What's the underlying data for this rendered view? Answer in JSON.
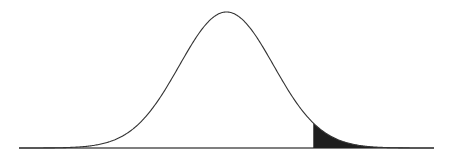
{
  "chart_data": {
    "type": "area",
    "title": "",
    "xlabel": "",
    "ylabel": "",
    "distribution": "normal",
    "mean": 0,
    "sd": 1,
    "xlim": [
      -4.4,
      4.4
    ],
    "shaded_region": {
      "from": 1.84,
      "to": 4.4,
      "tail": "right"
    },
    "grid": false,
    "legend": "none",
    "colors": {
      "curve": "#333333",
      "fill": "#1e1e1e",
      "axis": "#555555",
      "background": "#ffffff"
    }
  }
}
